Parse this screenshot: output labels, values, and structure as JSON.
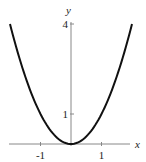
{
  "chart_data": {
    "type": "line",
    "title": "",
    "function": "y = x^2",
    "xlabel": "x",
    "ylabel": "y",
    "xlim": [
      -2.1,
      2.3
    ],
    "ylim": [
      0,
      4.3
    ],
    "x_ticks": [
      {
        "value": -1,
        "label": "-1"
      },
      {
        "value": 1,
        "label": "1"
      }
    ],
    "y_ticks": [
      {
        "value": 1,
        "label": "1"
      },
      {
        "value": 4,
        "label": "4"
      }
    ],
    "grid": false,
    "legend": null,
    "series": [
      {
        "name": "y = x^2",
        "x": [
          -2,
          -1.5,
          -1,
          -0.5,
          0,
          0.5,
          1,
          1.5,
          2
        ],
        "values": [
          4,
          2.25,
          1,
          0.25,
          0,
          0.25,
          1,
          2.25,
          4
        ],
        "color": "#000000"
      }
    ]
  }
}
